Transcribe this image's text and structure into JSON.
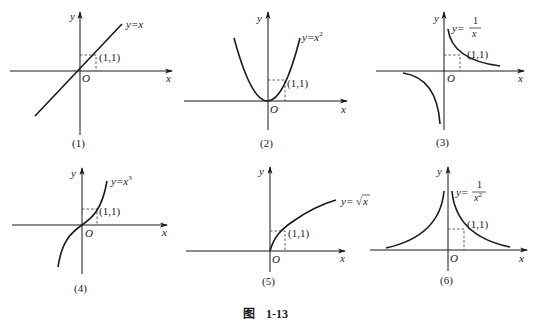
{
  "figure": {
    "caption_prefix": "图",
    "caption_number": "1-13"
  },
  "panels": [
    {
      "id": "1",
      "label": "(1)",
      "function": "y=x",
      "fn_lhs": "y=",
      "fn_rhs": "x",
      "point": "(1,1)",
      "x_axis": "x",
      "y_axis": "y",
      "origin": "O"
    },
    {
      "id": "2",
      "label": "(2)",
      "function": "y=x^2",
      "fn_lhs": "y=",
      "fn_base": "x",
      "fn_exp": "2",
      "point": "(1,1)",
      "x_axis": "x",
      "y_axis": "y",
      "origin": "O"
    },
    {
      "id": "3",
      "label": "(3)",
      "function": "y=1/x",
      "fn_lhs": "y=",
      "fn_num": "1",
      "fn_den": "x",
      "point": "(1,1)",
      "x_axis": "x",
      "y_axis": "y",
      "origin": "O"
    },
    {
      "id": "4",
      "label": "(4)",
      "function": "y=x^3",
      "fn_lhs": "y=",
      "fn_base": "x",
      "fn_exp": "3",
      "point": "(1,1)",
      "x_axis": "x",
      "y_axis": "y",
      "origin": "O"
    },
    {
      "id": "5",
      "label": "(5)",
      "function": "y=√x",
      "fn_lhs": "y=",
      "fn_rad": "√",
      "fn_arg": "x",
      "point": "(1,1)",
      "x_axis": "x",
      "y_axis": "y",
      "origin": "O"
    },
    {
      "id": "6",
      "label": "(6)",
      "function": "y=1/x^2",
      "fn_lhs": "y=",
      "fn_num": "1",
      "fn_den": "x",
      "fn_exp": "2",
      "point": "(1,1)",
      "x_axis": "x",
      "y_axis": "y",
      "origin": "O"
    }
  ]
}
